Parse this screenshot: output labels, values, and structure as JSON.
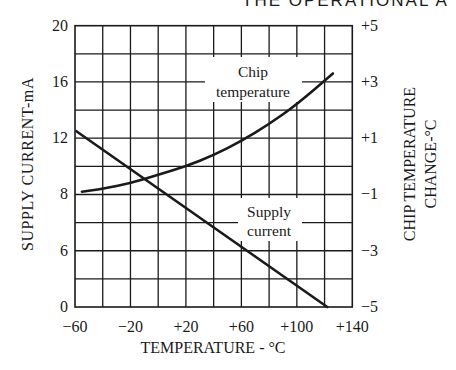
{
  "page": {
    "header_fragment": "THE OPERATIONAL A"
  },
  "chart_data": {
    "type": "line",
    "title": "",
    "xlabel": "TEMPERATURE - °C",
    "ylabel_left": "SUPPLY CURRENT-mA",
    "ylabel_right_line1": "CHIP TEMPERATURE",
    "ylabel_right_line2": "CHANGE-°C",
    "xlim": [
      -60,
      140
    ],
    "x_ticks": [
      "−60",
      "−20",
      "+20",
      "+60",
      "+100",
      "+140"
    ],
    "x_tick_values": [
      -60,
      -20,
      20,
      60,
      100,
      140
    ],
    "y_left_ticks": [
      "20",
      "16",
      "12",
      "8",
      "6",
      "0"
    ],
    "y_right_ticks": [
      "+5",
      "+3",
      "+1",
      "−1",
      "−3",
      "−5"
    ],
    "y_right_lim": [
      -5,
      5
    ],
    "grid": {
      "columns": 10,
      "rows": 10,
      "on": true
    },
    "legend": "inline annotations",
    "series": [
      {
        "name": "Supply current",
        "label_line1": "Supply",
        "label_line2": "current",
        "axis": "left",
        "unit": "mA",
        "x": [
          -59,
          122
        ],
        "grid_rows": [
          6.25,
          0.0
        ],
        "values_mA_approx": [
          12.5,
          0
        ]
      },
      {
        "name": "Chip temperature",
        "label_line1": "Chip",
        "label_line2": "temperature",
        "axis": "right",
        "unit": "°C",
        "x": [
          -55,
          -40,
          -20,
          0,
          20,
          40,
          60,
          80,
          100,
          126
        ],
        "values": [
          -0.9,
          -0.8,
          -0.6,
          -0.3,
          0.0,
          0.4,
          0.9,
          1.5,
          2.2,
          3.3
        ]
      }
    ]
  }
}
